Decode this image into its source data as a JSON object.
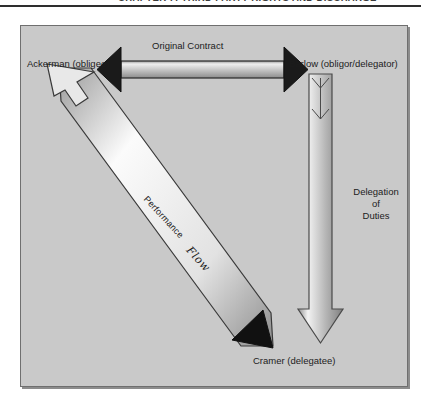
{
  "running_head": {
    "text": "Chapter 7: Third Party Rights and Discharge"
  },
  "figure": {
    "background_color": "#c9c9c9",
    "border_color": "#6f6f6f",
    "nodes": [
      {
        "id": "ackerman",
        "label": "Ackerman (obligee)"
      },
      {
        "id": "barlow",
        "label": "Barlow (obligor/delegator)"
      },
      {
        "id": "cramer",
        "label": "Cramer (delegatee)"
      }
    ],
    "edges": [
      {
        "id": "original-contract",
        "label": "Original Contract",
        "from": "ackerman",
        "to": "barlow",
        "direction": "bidirectional",
        "orientation": "horizontal",
        "arrowhead_color": "#1a1a1a"
      },
      {
        "id": "delegation-of-duties",
        "label": "Delegation\nof\nDuties",
        "label_line_1": "Delegation",
        "label_line_2": "of",
        "label_line_3": "Duties",
        "from": "barlow",
        "to": "cramer",
        "direction": "downward",
        "orientation": "vertical",
        "arrowhead_color": "#8f8f8f"
      },
      {
        "id": "performance-flow",
        "label": "Performance",
        "secondary_label": "Flow",
        "from": "cramer",
        "to": "ackerman",
        "direction": "bidirectional",
        "orientation": "diagonal",
        "arrowhead_color_head": "#e8e8e8",
        "arrowhead_color_tail": "#1a1a1a"
      }
    ]
  }
}
